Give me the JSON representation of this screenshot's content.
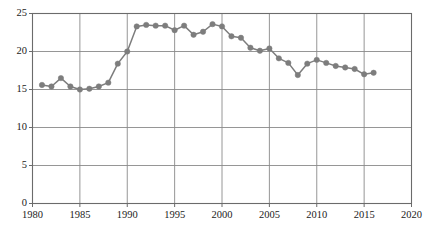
{
  "chart_data": {
    "type": "line",
    "title": "",
    "subtitle": "",
    "xlabel": "",
    "ylabel": "",
    "xlim": [
      1980,
      2020
    ],
    "ylim": [
      0,
      25
    ],
    "grid": true,
    "legend": null,
    "legend_position": "none",
    "xticks": [
      1980,
      1985,
      1990,
      1995,
      2000,
      2005,
      2010,
      2015,
      2020
    ],
    "yticks": [
      0,
      5,
      10,
      15,
      20,
      25
    ],
    "xtick_labels": [
      "1980",
      "1985",
      "1990",
      "1995",
      "2000",
      "2005",
      "2010",
      "2015",
      "2020"
    ],
    "ytick_labels": [
      "0",
      "5",
      "10",
      "15",
      "20",
      "25"
    ],
    "series": [
      {
        "name": "series-1",
        "color": "#7d7d7d",
        "marker": "circle",
        "x": [
          1981,
          1982,
          1983,
          1984,
          1985,
          1986,
          1987,
          1988,
          1989,
          1990,
          1991,
          1992,
          1993,
          1994,
          1995,
          1996,
          1997,
          1998,
          1999,
          2000,
          2001,
          2002,
          2003,
          2004,
          2005,
          2006,
          2007,
          2008,
          2009,
          2010,
          2011,
          2012,
          2013,
          2014,
          2015,
          2016
        ],
        "values": [
          15.6,
          15.4,
          16.5,
          15.4,
          15.0,
          15.1,
          15.4,
          15.9,
          18.4,
          20.0,
          23.3,
          23.5,
          23.4,
          23.4,
          22.8,
          23.4,
          22.2,
          22.6,
          23.6,
          23.3,
          22.0,
          21.8,
          20.5,
          20.1,
          20.4,
          19.1,
          18.5,
          16.9,
          18.4,
          18.9,
          18.5,
          18.1,
          17.9,
          17.7,
          17.0,
          17.2
        ]
      }
    ]
  },
  "axes": {
    "frame_color": "#6b6b6b",
    "grid_color": "#8a8a8a"
  }
}
